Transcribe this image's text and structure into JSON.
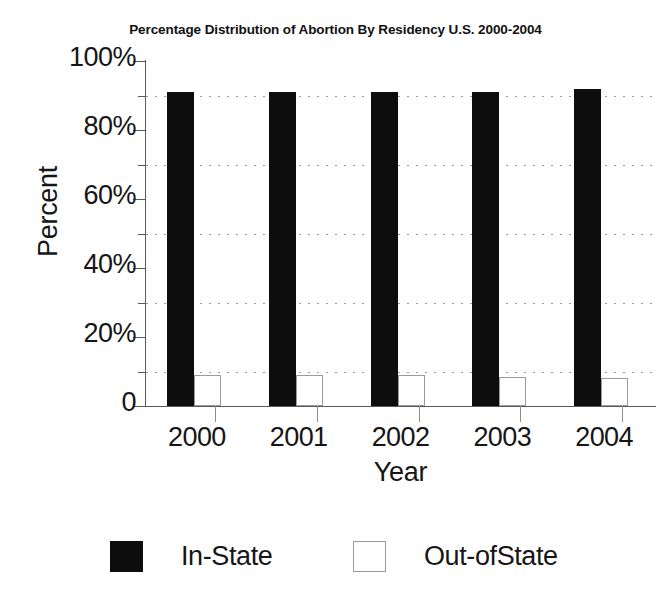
{
  "chart_data": {
    "type": "bar",
    "title": "Percentage Distribution of Abortion By Residency U.S. 2000-2004",
    "xlabel": "Year",
    "ylabel": "Percent",
    "categories": [
      "2000",
      "2001",
      "2002",
      "2003",
      "2004"
    ],
    "series": [
      {
        "name": "In-State",
        "color": "#0d0d0d",
        "values": [
          91,
          91,
          91,
          91,
          92
        ]
      },
      {
        "name": "Out-ofState",
        "color": "#ffffff",
        "values": [
          9,
          9,
          9,
          8.5,
          8
        ]
      }
    ],
    "ylim": [
      0,
      100
    ],
    "ytick_labels": [
      "0",
      "20%",
      "40%",
      "60%",
      "80%",
      "100%"
    ],
    "ytick_values": [
      0,
      20,
      40,
      60,
      80,
      100
    ],
    "minor_ytick_values": [
      10,
      30,
      50,
      70,
      90
    ],
    "grid": "horizontal-dotted",
    "legend_position": "bottom",
    "legend": [
      {
        "label": "In-State",
        "swatch": "filled"
      },
      {
        "label": "Out-ofState",
        "swatch": "hollow"
      }
    ]
  }
}
